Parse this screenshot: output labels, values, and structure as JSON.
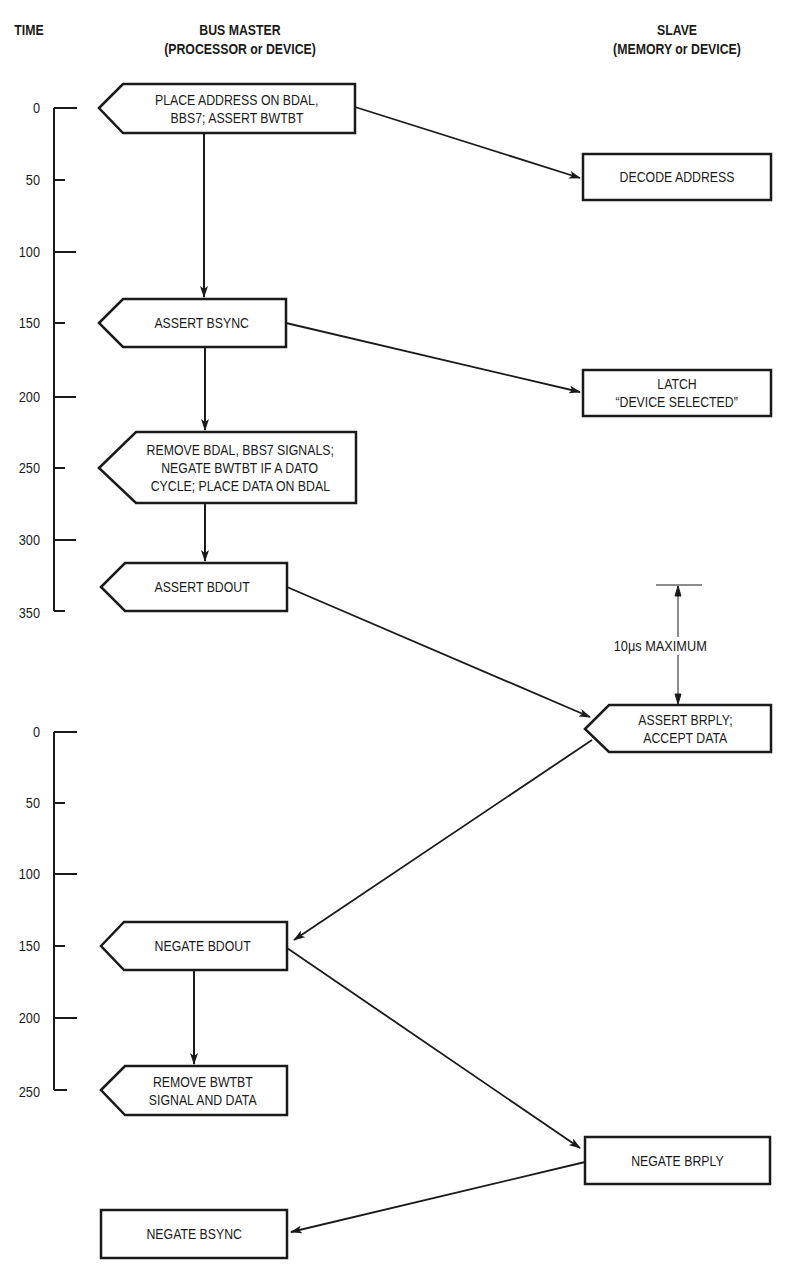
{
  "headers": {
    "time": "TIME",
    "master_title": "BUS MASTER",
    "master_sub": "(PROCESSOR or DEVICE)",
    "slave_title": "SLAVE",
    "slave_sub": "(MEMORY or DEVICE)"
  },
  "axis1": {
    "ticks": [
      "0",
      "50",
      "100",
      "150",
      "200",
      "250",
      "300",
      "350"
    ]
  },
  "axis2": {
    "ticks": [
      "0",
      "50",
      "100",
      "150",
      "200",
      "250"
    ]
  },
  "master_steps": [
    {
      "lines": [
        "PLACE ADDRESS ON BDAL,",
        "BBS7; ASSERT BWTBT"
      ]
    },
    {
      "lines": [
        "ASSERT BSYNC"
      ]
    },
    {
      "lines": [
        "REMOVE BDAL, BBS7 SIGNALS;",
        "NEGATE BWTBT IF A  DATO",
        "CYCLE; PLACE DATA ON BDAL"
      ]
    },
    {
      "lines": [
        "ASSERT BDOUT"
      ]
    },
    {
      "lines": [
        "NEGATE BDOUT"
      ]
    },
    {
      "lines": [
        "REMOVE BWTBT",
        "SIGNAL AND DATA"
      ]
    },
    {
      "lines": [
        "NEGATE BSYNC"
      ]
    }
  ],
  "slave_steps": [
    {
      "lines": [
        "DECODE ADDRESS"
      ]
    },
    {
      "lines": [
        "LATCH",
        "“DEVICE SELECTED”"
      ]
    },
    {
      "lines": [
        "ASSERT BRPLY;",
        "ACCEPT DATA"
      ]
    },
    {
      "lines": [
        "NEGATE BRPLY"
      ]
    }
  ],
  "annotation": {
    "timeout": "10μs MAXIMUM"
  },
  "colors": {
    "ink": "#1a1a1a",
    "background": "#ffffff"
  }
}
